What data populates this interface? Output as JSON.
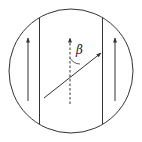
{
  "diagram": {
    "type": "physics-field-diagram",
    "angle_label": "β",
    "colors": {
      "stroke": "#333333",
      "background": "#ffffff"
    },
    "elements": {
      "circle": {
        "cx": 71,
        "cy": 71,
        "r": 62
      },
      "left_boundary": {
        "x": 39
      },
      "right_boundary": {
        "x": 102
      },
      "left_arrow": {
        "x": 28,
        "direction": "up"
      },
      "center_dashed_arrow": {
        "x": 70,
        "direction": "up",
        "style": "dashed"
      },
      "right_arrow": {
        "x": 115,
        "direction": "up"
      },
      "slanted_arrow": {
        "from": [
          44,
          98
        ],
        "to": [
          101,
          53
        ]
      }
    }
  }
}
